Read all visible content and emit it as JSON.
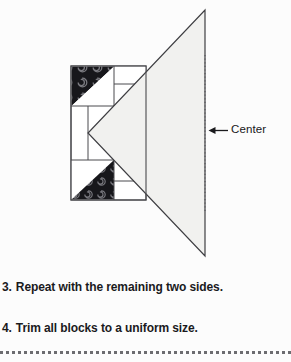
{
  "page": {
    "background_color": "#fcfcfc"
  },
  "figure": {
    "name": "quilt-block-center-triangle-diagram",
    "colors": {
      "outline": "#4a4a4e",
      "light_fill": "#f0f0ee",
      "dark_fill": "#1b1b1f",
      "swirl": "#6e6e74",
      "white_fill": "#ffffff",
      "dotted_line": "#55555a",
      "arrow": "#1a1a1d"
    },
    "block_rect": {
      "x": 71,
      "y": 66,
      "width": 75,
      "height": 134
    },
    "large_triangle": {
      "label": "center-triangle",
      "points": "205,10 205,256 88,133"
    },
    "dark_patches": [
      {
        "label": "dark-triangle-top",
        "points": "75,70 114,70 114,105 75,105"
      },
      {
        "label": "dark-triangle-bottom",
        "points": "75,161 114,161 114,196 75,196"
      }
    ],
    "dotted_center_line": {
      "x": 205,
      "y1": 55,
      "y2": 212
    },
    "arrow": {
      "from_x": 228,
      "to_x": 209,
      "y": 130
    }
  },
  "center_callout": {
    "label": "Center"
  },
  "steps": [
    {
      "number": "3.",
      "text": "Repeat with the remaining two sides."
    },
    {
      "number": "4.",
      "text": "Trim all blocks to a uniform size."
    }
  ],
  "bottom_rule": {
    "style": "dashed"
  }
}
